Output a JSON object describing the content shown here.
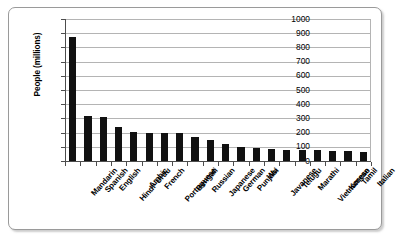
{
  "chart_data": {
    "type": "bar",
    "title": "",
    "subtitle": "",
    "xlabel": "",
    "ylabel": "People (millions)",
    "ylim": [
      0,
      1000
    ],
    "ytick_labels": [
      "1000",
      "900",
      "800",
      "700",
      "600",
      "500",
      "400",
      "300",
      "200",
      "100",
      "0"
    ],
    "yticks": [
      1000,
      900,
      800,
      700,
      600,
      500,
      400,
      300,
      200,
      100,
      0
    ],
    "grid": true,
    "legend": false,
    "bar_color": "#111111",
    "categories": [
      "Mandarin",
      "Spanish",
      "English",
      "Hindi–Urdu",
      "Arabic",
      "French",
      "Portuguese",
      "Bengali",
      "Russian",
      "Japanese",
      "German",
      "Punjabi",
      "Wu",
      "Javanese",
      "Telugu",
      "Marathi",
      "Vietnamese",
      "Korean",
      "Tamil",
      "Italian"
    ],
    "values": [
      870,
      320,
      310,
      240,
      205,
      200,
      200,
      200,
      170,
      145,
      120,
      100,
      90,
      85,
      80,
      75,
      75,
      70,
      70,
      65
    ]
  },
  "axes": {
    "y_title": "People (millions)"
  }
}
